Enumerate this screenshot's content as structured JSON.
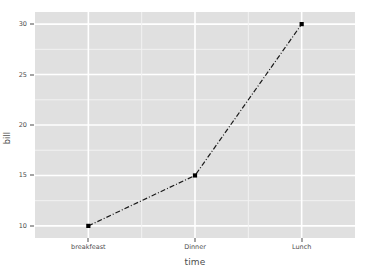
{
  "chart_data": {
    "type": "line",
    "title": "",
    "subtitle": "",
    "xlabel": "time",
    "ylabel": "bill",
    "categories": [
      "breakfeast",
      "Dinner",
      "Lunch"
    ],
    "values": [
      10,
      15,
      30
    ],
    "series": [
      {
        "name": "bill",
        "values": [
          10,
          15,
          30
        ]
      }
    ],
    "points": [
      {
        "x": "breakfeast",
        "y": 10
      },
      {
        "x": "Dinner",
        "y": 15
      },
      {
        "x": "Lunch",
        "y": 30
      }
    ],
    "ylim": [
      8.8,
      31.2
    ],
    "y_ticks": [
      "10",
      "15",
      "20",
      "25",
      "30"
    ],
    "y_tick_values": [
      10,
      15,
      20,
      25,
      30
    ],
    "y_minor_values": [
      12.5,
      17.5,
      22.5,
      27.5
    ],
    "x_ticks": [
      "breakfeast",
      "Dinner",
      "Lunch"
    ],
    "grid": true,
    "legend": "none",
    "line_style": "dashdot",
    "marker": "square",
    "colors": {
      "panel_background": "#e0e0e0",
      "major_gridline": "#ffffff",
      "minor_gridline": "#f2f2f2",
      "line": "#1a1a1a",
      "marker": "#000000",
      "axis_text": "#4d4d4d",
      "figure_background": "#ffffff"
    }
  }
}
